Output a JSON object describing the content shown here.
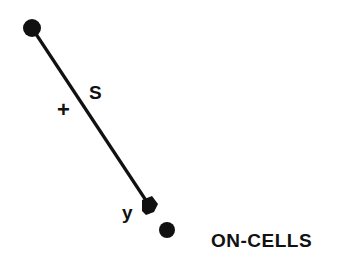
{
  "diagram": {
    "labels": {
      "s": "S",
      "plus": "+",
      "y": "y",
      "cells": "ON-CELLS"
    },
    "colors": {
      "ink": "#111111",
      "background": "#ffffff"
    }
  }
}
